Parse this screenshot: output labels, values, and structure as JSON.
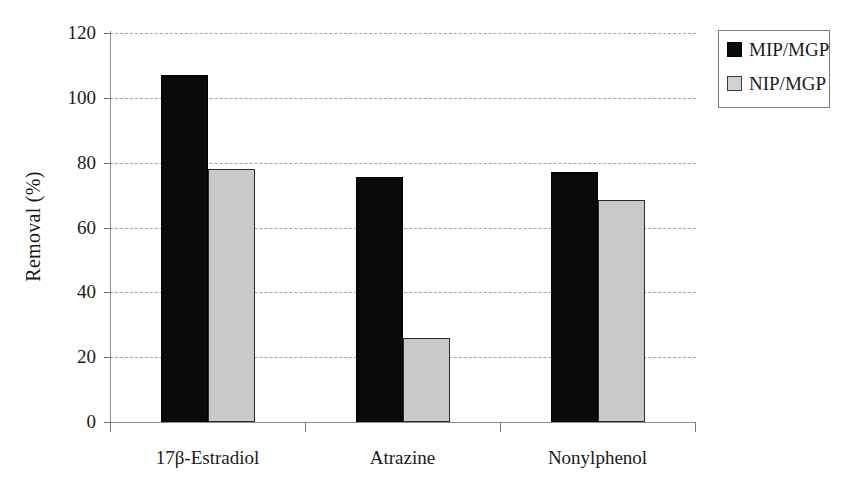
{
  "chart_data": {
    "type": "bar",
    "title": "",
    "xlabel": "",
    "ylabel": "Removal (%)",
    "categories": [
      "17β-Estradiol",
      "Atrazine",
      "Nonylphenol"
    ],
    "series": [
      {
        "name": "MIP/MGP",
        "color": "#0a0a0a",
        "values": [
          107,
          75.5,
          77
        ]
      },
      {
        "name": "NIP/MGP",
        "color": "#c9c9c9",
        "values": [
          78,
          26,
          68.5
        ]
      }
    ],
    "ylim": [
      0,
      120
    ],
    "ytick_values": [
      0,
      20,
      40,
      60,
      80,
      100,
      120
    ],
    "ytick_labels": [
      "0",
      "20",
      "40",
      "60",
      "80",
      "100",
      "120"
    ],
    "grid": "horizontal-dashed",
    "legend_position": "outside-top-right",
    "legend_entries": [
      "MIP/MGP",
      "NIP/MGP"
    ]
  },
  "axes": {
    "y_title": "Removal (%)"
  }
}
